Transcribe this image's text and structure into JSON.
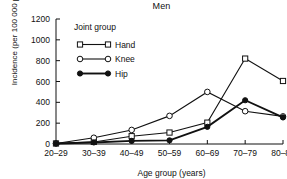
{
  "chart_data": {
    "type": "line",
    "title": "Men",
    "xlabel": "Age group (years)",
    "ylabel": "Incidence (per 100 000 person-years)",
    "categories": [
      "20–29",
      "30–39",
      "40–49",
      "50–59",
      "60–69",
      "70–79",
      "80–89"
    ],
    "ylim": [
      0,
      1200
    ],
    "yticks": [
      0,
      200,
      400,
      600,
      800,
      1000,
      1200
    ],
    "ytick_labels": [
      "0",
      "200",
      "400",
      "600",
      "800",
      "1000",
      "1200"
    ],
    "grid": false,
    "legend_position": "upper-left",
    "legend_title": "Joint group",
    "series": [
      {
        "name": "Hand",
        "marker": "open-square",
        "line": "thin",
        "values": [
          5,
          20,
          75,
          110,
          205,
          820,
          605
        ]
      },
      {
        "name": "Knee",
        "marker": "open-circle",
        "line": "thin",
        "values": [
          5,
          60,
          135,
          270,
          500,
          315,
          265
        ]
      },
      {
        "name": "Hip",
        "marker": "filled-circle",
        "line": "thick",
        "values": [
          5,
          15,
          30,
          35,
          165,
          420,
          255
        ]
      }
    ]
  },
  "colors": {
    "ink": "#111111",
    "background": "#ffffff"
  }
}
